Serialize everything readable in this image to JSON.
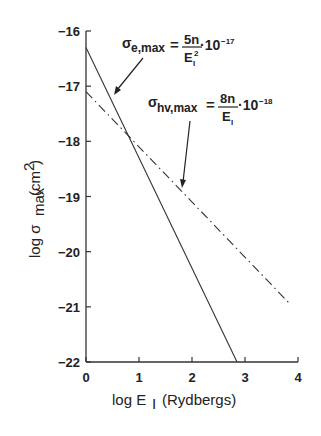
{
  "chart_data": {
    "type": "line",
    "title": "",
    "xlabel": "log E_I (Rydbergs)",
    "ylabel": "log σ_max (cm²)",
    "xlim": [
      0,
      4
    ],
    "ylim": [
      -22,
      -16
    ],
    "x_ticks": [
      "0",
      "1",
      "2",
      "3",
      "4"
    ],
    "y_ticks": [
      "-16",
      "-17",
      "-18",
      "-19",
      "-20",
      "-21",
      "-22"
    ],
    "grid": false,
    "series": [
      {
        "name": "σ_e,max = 5n/E_I² · 10^-17",
        "style": "solid",
        "x": [
          0,
          2.85
        ],
        "y": [
          -16.3,
          -22
        ]
      },
      {
        "name": "σ_hν,max = 8n/E_I · 10^-18",
        "style": "dash-dot",
        "x": [
          0,
          3.85
        ],
        "y": [
          -17.1,
          -20.95
        ]
      }
    ],
    "annotations": [
      {
        "text": "σ_e,max = 5n/E_I² · 10^-17",
        "arrow_to": [
          0.55,
          -17.4
        ]
      },
      {
        "text": "σ_hν,max = 8n/E_I · 10^-18",
        "arrow_to": [
          1.75,
          -18.85
        ]
      }
    ]
  },
  "labels": {
    "xlabel_main": "log E",
    "xlabel_sub": "I",
    "xlabel_unit": "(Rydbergs)",
    "ylabel_main": "log σ",
    "ylabel_sub": "max",
    "ylabel_unit": "(cm",
    "ylabel_sup": "2",
    "ylabel_close": ")",
    "eq1_sigma": "σ",
    "eq1_sub": "e,max",
    "eq1_eq": "=",
    "eq1_num": "5n",
    "eq1_den": "E",
    "eq1_den_sub": "I",
    "eq1_den_sup": "2",
    "eq1_factor": "·10",
    "eq1_exp": "−17",
    "eq2_sigma": "σ",
    "eq2_sub": "hv,max",
    "eq2_eq": "=",
    "eq2_num": "8n",
    "eq2_den": "E",
    "eq2_den_sub": "I",
    "eq2_factor": "·10",
    "eq2_exp": "−18"
  }
}
